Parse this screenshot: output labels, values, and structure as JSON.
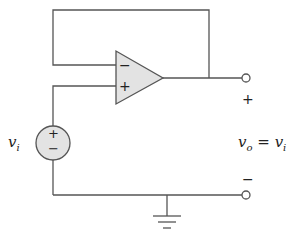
{
  "diagram": {
    "colors": {
      "wire": "#555555",
      "fill": "#e3e3e3",
      "text": "#222222"
    },
    "opamp": {
      "inverting_label": "−",
      "noninverting_label": "+"
    },
    "source": {
      "name_base": "v",
      "name_sub": "i",
      "plus": "+",
      "minus": "−"
    },
    "output": {
      "plus_terminal_label": "+",
      "minus_terminal_label": "−",
      "equation_lhs_base": "v",
      "equation_lhs_sub": "o",
      "equation_eq": " = ",
      "equation_rhs_base": "v",
      "equation_rhs_sub": "i"
    },
    "ground": {
      "symbol": "ground"
    }
  }
}
